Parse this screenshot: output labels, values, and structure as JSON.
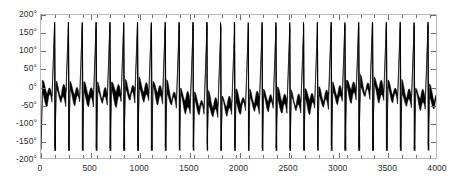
{
  "chart_data": {
    "type": "line",
    "title": "",
    "xlabel": "",
    "ylabel": "",
    "xlim": [
      0,
      4000
    ],
    "ylim": [
      -200,
      200
    ],
    "grid": false,
    "legend": null,
    "series_color": "#000000",
    "frame_color": "#b9b9b9",
    "background": "#ffffff",
    "y_ticks": [
      200,
      150,
      100,
      50,
      0,
      -50,
      -100,
      -150,
      -200
    ],
    "y_tick_labels": [
      "200°",
      "150°",
      "100°",
      "50°",
      "0°",
      "-50°",
      "-100°",
      "-150°",
      "-200°"
    ],
    "x_ticks": [
      0,
      500,
      1000,
      1500,
      2000,
      2500,
      3000,
      3500,
      4000
    ],
    "x_tick_labels": [
      "0",
      "500",
      "1000",
      "1500",
      "2000",
      "2500",
      "3000",
      "3500",
      "4000"
    ],
    "x_minor_step": 140,
    "signal": {
      "kind": "wrapped-phase-sawtooth-with-noise",
      "period_samples": 140,
      "cycle_count": 29,
      "wrap_low_deg": -180,
      "wrap_high_deg": 180,
      "noise_amplitude_deg": 20,
      "sample_count": 4000,
      "peak_deg": 180,
      "trough_deg": -180,
      "plateau_center_deg": -10
    }
  }
}
